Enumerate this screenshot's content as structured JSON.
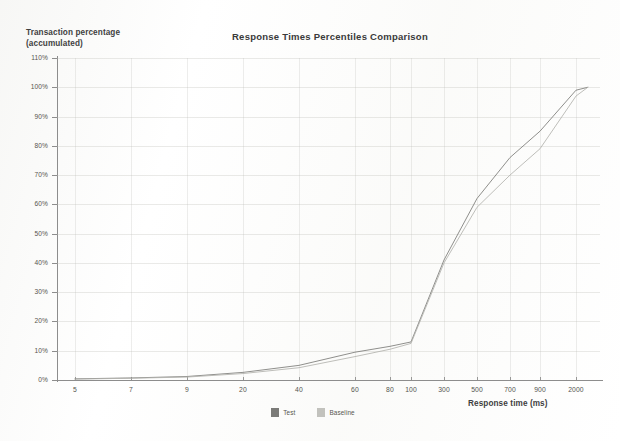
{
  "chart_data": {
    "type": "line",
    "title": "Response Times Percentiles Comparison",
    "xlabel": "Response time (ms)",
    "ylabel": "Transaction percentage\n(accumulated)",
    "grid": true,
    "legend_position": "bottom",
    "xscale": "log-category",
    "xticks": [
      "5",
      "7",
      "9",
      "20",
      "40",
      "60",
      "80",
      "100",
      "300",
      "500",
      "700",
      "900",
      "2000"
    ],
    "yticks": [
      "0%",
      "10%",
      "20%",
      "30%",
      "40%",
      "50%",
      "60%",
      "70%",
      "80%",
      "90%",
      "100%",
      "110%"
    ],
    "ylim": [
      0,
      110
    ],
    "series": [
      {
        "name": "Test",
        "color": "#7b7b78",
        "x": [
          5,
          7,
          9,
          20,
          40,
          60,
          80,
          100,
          300,
          500,
          700,
          900,
          2000,
          2600
        ],
        "values": [
          0.4,
          0.7,
          1.2,
          2.6,
          5.0,
          9.5,
          11.5,
          13.0,
          41.0,
          62.0,
          76.0,
          85.0,
          99.0,
          100.0
        ]
      },
      {
        "name": "Baseline",
        "color": "#b3b3ae",
        "x": [
          5,
          7,
          9,
          20,
          40,
          60,
          80,
          100,
          300,
          500,
          700,
          900,
          2000,
          2600
        ],
        "values": [
          0.3,
          0.6,
          1.0,
          2.2,
          4.2,
          8.0,
          10.5,
          12.5,
          40.0,
          59.0,
          70.0,
          79.0,
          97.0,
          100.0
        ]
      }
    ]
  },
  "legend": {
    "items": [
      {
        "label": "Test",
        "color": "#7b7b78"
      },
      {
        "label": "Baseline",
        "color": "#c2c2bd"
      }
    ]
  }
}
